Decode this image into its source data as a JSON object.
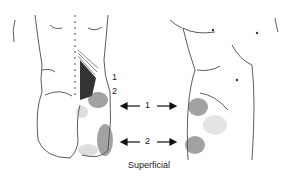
{
  "figure": {
    "caption": "Superficial",
    "back_labels": [
      "1",
      "2"
    ],
    "arrows": [
      {
        "label": "1"
      },
      {
        "label": "2"
      }
    ],
    "views": [
      "posterior-view",
      "lateral-anterior-view"
    ],
    "colors": {
      "line": "#333333",
      "stipple": "#444444",
      "dense": "#555555"
    }
  }
}
